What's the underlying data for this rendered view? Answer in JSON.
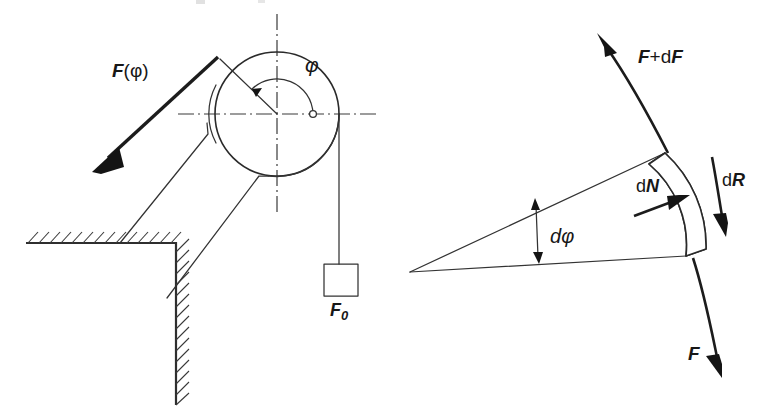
{
  "figure": {
    "background_color": "#ffffff",
    "line_color": "#2a2a2a",
    "label_color": "#171717"
  },
  "left_diagram": {
    "name": "pulley-with-wall-bracket",
    "labels": {
      "applied_force": "F(φ)",
      "applied_force_main": "F",
      "applied_force_arg": "(φ)",
      "wrap_angle": "φ",
      "weight_force": "F",
      "weight_force_sub": "0"
    }
  },
  "right_diagram": {
    "name": "belt-element-free-body",
    "labels": {
      "tension_out_prefix": "F",
      "tension_out_mid": "+d",
      "tension_out_suffix": "F",
      "tension_out": "F+dF",
      "normal_force_d": "d",
      "normal_force_n": "N",
      "normal_force": "dN",
      "resultant_d": "d",
      "resultant_r": "R",
      "resultant_force": "dR",
      "angle_d": "d",
      "angle_phi": "φ",
      "angle_element": "dφ",
      "tension_in": "F"
    }
  }
}
